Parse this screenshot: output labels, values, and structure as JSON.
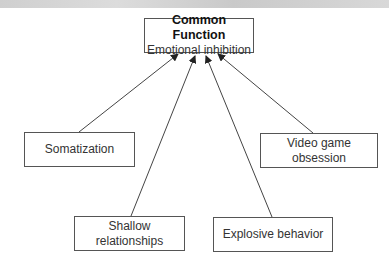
{
  "diagram": {
    "root": {
      "title": "Common Function",
      "subtitle": "Emotional inhibition"
    },
    "nodes": [
      {
        "id": "somatization",
        "line1": "Somatization",
        "line2": ""
      },
      {
        "id": "video-game",
        "line1": "Video game",
        "line2": "obsession"
      },
      {
        "id": "shallow",
        "line1": "Shallow",
        "line2": "relationships"
      },
      {
        "id": "explosive",
        "line1": "Explosive behavior",
        "line2": ""
      }
    ],
    "edges": [
      {
        "from": "somatization",
        "to": "root"
      },
      {
        "from": "shallow",
        "to": "root"
      },
      {
        "from": "explosive",
        "to": "root"
      },
      {
        "from": "video-game",
        "to": "root"
      }
    ]
  }
}
